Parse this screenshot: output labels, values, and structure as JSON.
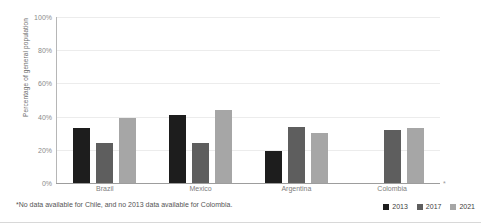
{
  "chart_data": {
    "type": "bar",
    "title": "",
    "subtitle": "",
    "xlabel": "",
    "ylabel": "Percentage of general population",
    "ylim": [
      0,
      100
    ],
    "ytick_labels": [
      "100%",
      "80%",
      "60%",
      "40%",
      "20%",
      "0%"
    ],
    "ytick_values": [
      100,
      80,
      60,
      40,
      20,
      0
    ],
    "grid": true,
    "legend_position": "bottom-right",
    "categories": [
      "Brazil",
      "Mexico",
      "Argentina",
      "Colombia"
    ],
    "series": [
      {
        "name": "2013",
        "color": "#1d1d1d",
        "values": [
          33,
          41,
          19,
          null
        ]
      },
      {
        "name": "2017",
        "color": "#5e5e5e",
        "values": [
          24,
          24,
          34,
          32
        ]
      },
      {
        "name": "2021",
        "color": "#a6a6a6",
        "values": [
          39,
          44,
          30,
          33
        ]
      }
    ],
    "annotations": {
      "axis_asterisk": "*",
      "footnote": "*No data available for Chile, and no 2013 data available for Colombia."
    }
  },
  "legend": {
    "items": [
      {
        "label": "2013"
      },
      {
        "label": "2017"
      },
      {
        "label": "2021"
      }
    ]
  }
}
